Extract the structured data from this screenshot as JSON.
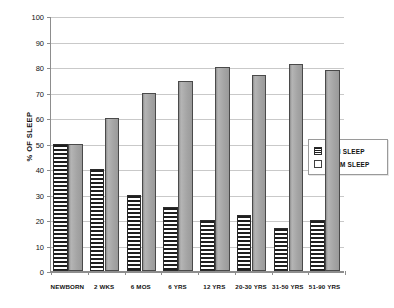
{
  "chart_data": {
    "type": "bar",
    "title": "",
    "subtitle": "",
    "xlabel": "",
    "ylabel": "% OF SLEEP",
    "ylim": [
      0,
      100
    ],
    "ytick_step": 10,
    "yticks": [
      0,
      10,
      20,
      30,
      40,
      50,
      60,
      70,
      80,
      90,
      100
    ],
    "grid": true,
    "grid_axis": "y",
    "legend_position": "right",
    "categories": [
      "NEWBORN",
      "2 WKS",
      "6 MOS",
      "6 YRS",
      "12 YRS",
      "20-30 YRS",
      "31-50 YRS",
      "51-90 YRS"
    ],
    "series": [
      {
        "name": "REM SLEEP",
        "pattern": "horizontal-stripes",
        "color": "#1f1f1f",
        "values": [
          50,
          40,
          30,
          25,
          20,
          22,
          17,
          20
        ]
      },
      {
        "name": "NREM SLEEP",
        "pattern": "solid-gray",
        "color": "#a5a5a5",
        "values": [
          50,
          60,
          70,
          74.5,
          80,
          77,
          81,
          79
        ]
      }
    ]
  },
  "legend": {
    "items": [
      {
        "label": "REM SLEEP",
        "swatch": "rem"
      },
      {
        "label": "NREM SLEEP",
        "swatch": "nrem"
      }
    ]
  }
}
